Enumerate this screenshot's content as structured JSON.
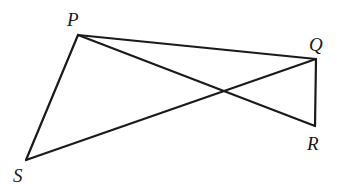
{
  "diagram": {
    "type": "geometry-figure",
    "stroke_color": "#1a1a1a",
    "background": "#ffffff",
    "points": [
      {
        "name": "P",
        "x": 78,
        "y": 35,
        "label_x": 67,
        "label_y": 26
      },
      {
        "name": "Q",
        "x": 316,
        "y": 59,
        "label_x": 309,
        "label_y": 51
      },
      {
        "name": "R",
        "x": 315,
        "y": 126,
        "label_x": 307,
        "label_y": 150
      },
      {
        "name": "S",
        "x": 26,
        "y": 160,
        "label_x": 13,
        "label_y": 184
      }
    ],
    "segments": [
      {
        "from": "P",
        "to": "Q"
      },
      {
        "from": "P",
        "to": "R"
      },
      {
        "from": "Q",
        "to": "R"
      },
      {
        "from": "P",
        "to": "S"
      },
      {
        "from": "S",
        "to": "Q"
      }
    ],
    "labels": {
      "P": "P",
      "Q": "Q",
      "R": "R",
      "S": "S"
    }
  }
}
